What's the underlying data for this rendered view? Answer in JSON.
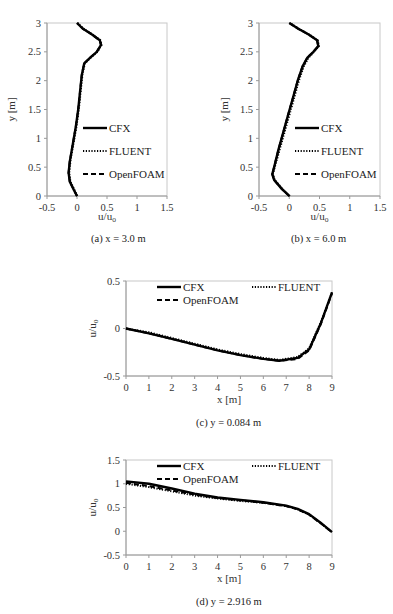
{
  "chart_data": [
    {
      "id": "a",
      "type": "line",
      "caption": "(a)  x = 3.0 m",
      "xlabel": "u/u",
      "xlabel_sub": "o",
      "ylabel": "y [m]",
      "xlim": [
        -0.5,
        1.5
      ],
      "ylim": [
        0,
        3
      ],
      "xticks": [
        "-0.5",
        "0",
        "0.5",
        "1",
        "1.5"
      ],
      "yticks": [
        "0",
        "0.5",
        "1",
        "1.5",
        "2",
        "2.5",
        "3"
      ],
      "grid": false,
      "legend": [
        "CFX",
        "FLUENT",
        "OpenFOAM"
      ],
      "legend_position": "center-right",
      "series": [
        {
          "name": "CFX",
          "style": "solid",
          "x": [
            0.0,
            -0.05,
            -0.12,
            -0.14,
            -0.12,
            -0.07,
            -0.02,
            0.02,
            0.05,
            0.08,
            0.12,
            0.22,
            0.33,
            0.4,
            0.38,
            0.25,
            0.1,
            0.0
          ],
          "y": [
            0.0,
            0.1,
            0.25,
            0.4,
            0.6,
            0.9,
            1.2,
            1.5,
            1.8,
            2.1,
            2.3,
            2.4,
            2.5,
            2.62,
            2.7,
            2.8,
            2.9,
            3.0
          ]
        },
        {
          "name": "FLUENT",
          "style": "dotted",
          "x": [
            0.0,
            -0.04,
            -0.11,
            -0.13,
            -0.11,
            -0.06,
            -0.01,
            0.03,
            0.06,
            0.09,
            0.13,
            0.23,
            0.34,
            0.41,
            0.39,
            0.26,
            0.11,
            0.01
          ],
          "y": [
            0.0,
            0.1,
            0.25,
            0.4,
            0.6,
            0.9,
            1.2,
            1.5,
            1.8,
            2.1,
            2.3,
            2.4,
            2.5,
            2.62,
            2.7,
            2.8,
            2.9,
            3.0
          ]
        },
        {
          "name": "OpenFOAM",
          "style": "dashed",
          "x": [
            0.0,
            -0.05,
            -0.12,
            -0.14,
            -0.12,
            -0.07,
            -0.02,
            0.02,
            0.05,
            0.08,
            0.12,
            0.22,
            0.33,
            0.4,
            0.38,
            0.25,
            0.1,
            0.0
          ],
          "y": [
            0.0,
            0.1,
            0.25,
            0.4,
            0.6,
            0.9,
            1.2,
            1.5,
            1.8,
            2.1,
            2.3,
            2.4,
            2.5,
            2.62,
            2.7,
            2.8,
            2.9,
            3.0
          ]
        }
      ]
    },
    {
      "id": "b",
      "type": "line",
      "caption": "(b)  x = 6.0 m",
      "xlabel": "u/u",
      "xlabel_sub": "o",
      "ylabel": "y [m]",
      "xlim": [
        -0.5,
        1.5
      ],
      "ylim": [
        0,
        3
      ],
      "xticks": [
        "-0.5",
        "0",
        "0.5",
        "1",
        "1.5"
      ],
      "yticks": [
        "0",
        "0.5",
        "1",
        "1.5",
        "2",
        "2.5",
        "3"
      ],
      "grid": false,
      "legend": [
        "CFX",
        "FLUENT",
        "OpenFOAM"
      ],
      "legend_position": "center-right",
      "series": [
        {
          "name": "CFX",
          "style": "solid",
          "x": [
            0.0,
            -0.12,
            -0.25,
            -0.28,
            -0.25,
            -0.18,
            -0.1,
            -0.02,
            0.06,
            0.14,
            0.22,
            0.3,
            0.4,
            0.48,
            0.46,
            0.32,
            0.15,
            0.0
          ],
          "y": [
            0.0,
            0.12,
            0.28,
            0.38,
            0.5,
            0.8,
            1.1,
            1.4,
            1.7,
            2.0,
            2.25,
            2.4,
            2.5,
            2.6,
            2.7,
            2.8,
            2.9,
            3.0
          ]
        },
        {
          "name": "FLUENT",
          "style": "dotted",
          "x": [
            0.01,
            -0.11,
            -0.24,
            -0.27,
            -0.24,
            -0.16,
            -0.08,
            0.0,
            0.08,
            0.16,
            0.24,
            0.32,
            0.41,
            0.49,
            0.47,
            0.33,
            0.16,
            0.01
          ],
          "y": [
            0.0,
            0.12,
            0.28,
            0.38,
            0.5,
            0.8,
            1.1,
            1.4,
            1.7,
            2.0,
            2.25,
            2.4,
            2.5,
            2.6,
            2.7,
            2.8,
            2.9,
            3.0
          ]
        },
        {
          "name": "OpenFOAM",
          "style": "dashed",
          "x": [
            0.0,
            -0.12,
            -0.25,
            -0.28,
            -0.25,
            -0.18,
            -0.1,
            -0.02,
            0.06,
            0.14,
            0.22,
            0.3,
            0.4,
            0.48,
            0.46,
            0.32,
            0.15,
            0.0
          ],
          "y": [
            0.0,
            0.12,
            0.28,
            0.38,
            0.5,
            0.8,
            1.1,
            1.4,
            1.7,
            2.0,
            2.25,
            2.4,
            2.5,
            2.6,
            2.7,
            2.8,
            2.9,
            3.0
          ]
        }
      ]
    },
    {
      "id": "c",
      "type": "line",
      "caption": "(c)  y = 0.084 m",
      "xlabel": "x [m]",
      "ylabel": "u/u",
      "ylabel_sub": "o",
      "xlim": [
        0,
        9
      ],
      "ylim": [
        -0.5,
        0.5
      ],
      "xticks": [
        "0",
        "1",
        "2",
        "3",
        "4",
        "5",
        "6",
        "7",
        "8",
        "9"
      ],
      "yticks": [
        "-0.5",
        "0",
        "0.5"
      ],
      "grid": false,
      "legend": [
        "CFX",
        "FLUENT",
        "OpenFOAM"
      ],
      "legend_position": "top",
      "series": [
        {
          "name": "CFX",
          "style": "solid",
          "x": [
            0,
            1,
            2,
            3,
            4,
            5,
            6,
            6.7,
            7.5,
            8.0,
            8.5,
            9.0
          ],
          "y": [
            0.0,
            -0.05,
            -0.11,
            -0.17,
            -0.23,
            -0.28,
            -0.32,
            -0.34,
            -0.31,
            -0.22,
            0.05,
            0.38
          ]
        },
        {
          "name": "FLUENT",
          "style": "dotted",
          "x": [
            0,
            1,
            2,
            3,
            4,
            5,
            6,
            6.7,
            7.5,
            8.0,
            8.5,
            9.0
          ],
          "y": [
            0.0,
            -0.04,
            -0.1,
            -0.16,
            -0.22,
            -0.27,
            -0.31,
            -0.33,
            -0.3,
            -0.21,
            0.06,
            0.38
          ]
        },
        {
          "name": "OpenFOAM",
          "style": "dashed",
          "x": [
            0,
            1,
            2,
            3,
            4,
            5,
            6,
            6.7,
            7.5,
            8.0,
            8.5,
            9.0
          ],
          "y": [
            0.0,
            -0.05,
            -0.11,
            -0.17,
            -0.23,
            -0.28,
            -0.32,
            -0.34,
            -0.32,
            -0.23,
            0.04,
            0.37
          ]
        }
      ]
    },
    {
      "id": "d",
      "type": "line",
      "caption": "(d)  y = 2.916 m",
      "xlabel": "x [m]",
      "ylabel": "u/u",
      "ylabel_sub": "o",
      "xlim": [
        0,
        9
      ],
      "ylim": [
        -0.5,
        1.5
      ],
      "xticks": [
        "0",
        "1",
        "2",
        "3",
        "4",
        "5",
        "6",
        "7",
        "8",
        "9"
      ],
      "yticks": [
        "-0.5",
        "0",
        "0.5",
        "1",
        "1.5"
      ],
      "grid": false,
      "legend": [
        "CFX",
        "FLUENT",
        "OpenFOAM"
      ],
      "legend_position": "top",
      "series": [
        {
          "name": "CFX",
          "style": "solid",
          "x": [
            0,
            1,
            2,
            3,
            4,
            5,
            6,
            7,
            7.5,
            8,
            8.5,
            9
          ],
          "y": [
            1.05,
            1.0,
            0.9,
            0.79,
            0.71,
            0.66,
            0.61,
            0.54,
            0.47,
            0.36,
            0.18,
            -0.02
          ]
        },
        {
          "name": "FLUENT",
          "style": "dotted",
          "x": [
            0,
            1,
            2,
            3,
            4,
            5,
            6,
            7,
            7.5,
            8,
            8.5,
            9
          ],
          "y": [
            1.0,
            0.93,
            0.84,
            0.75,
            0.69,
            0.64,
            0.6,
            0.53,
            0.46,
            0.35,
            0.17,
            -0.02
          ]
        },
        {
          "name": "OpenFOAM",
          "style": "dashed",
          "x": [
            0,
            1,
            2,
            3,
            4,
            5,
            6,
            7,
            7.5,
            8,
            8.5,
            9
          ],
          "y": [
            1.02,
            0.95,
            0.86,
            0.77,
            0.7,
            0.65,
            0.6,
            0.53,
            0.46,
            0.35,
            0.17,
            -0.02
          ]
        }
      ]
    }
  ],
  "panels": {
    "a": {
      "caption": "(a)  x = 3.0 m"
    },
    "b": {
      "caption": "(b)  x = 6.0 m"
    },
    "c": {
      "caption": "(c)  y = 0.084 m"
    },
    "d": {
      "caption": "(d)  y = 2.916 m"
    }
  },
  "legend_labels": {
    "cfx": "CFX",
    "fluent": "FLUENT",
    "openfoam": "OpenFOAM"
  }
}
